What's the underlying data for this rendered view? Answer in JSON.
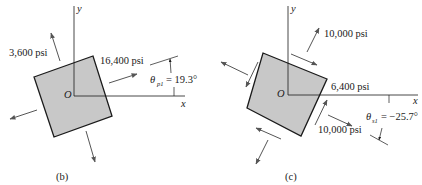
{
  "figures": [
    {
      "id": "b",
      "caption": "(b)",
      "axis_labels": {
        "x": "x",
        "y": "y",
        "origin": "O"
      },
      "stress_labels": {
        "sigma_2": "3,600 psi",
        "sigma_1": "16,400 psi"
      },
      "angle": {
        "symbol": "θ",
        "subscript": "p1",
        "equals": "= 19.3°",
        "value_deg": 19.3
      },
      "element_fill": "#c8c8c8"
    },
    {
      "id": "c",
      "caption": "(c)",
      "axis_labels": {
        "x": "x",
        "y": "y",
        "origin": "O"
      },
      "stress_labels": {
        "normal_top": "10,000 psi",
        "shear": "6,400 psi",
        "normal_bottom": "10,000 psi"
      },
      "angle": {
        "symbol": "θ",
        "subscript": "s1",
        "equals": "= −25.7°",
        "value_deg": -25.7
      },
      "element_fill": "#c8c8c8"
    }
  ],
  "colors": {
    "line": "#1a1a1a",
    "arrow": "#555555",
    "element_fill": "#c8c8c8"
  }
}
